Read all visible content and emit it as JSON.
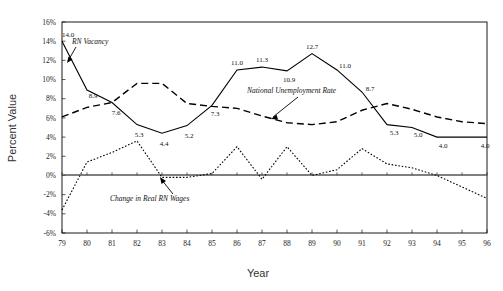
{
  "chart_data": {
    "type": "line",
    "title": "",
    "xlabel": "Year",
    "ylabel": "Percent Value",
    "x": [
      "79",
      "80",
      "81",
      "82",
      "83",
      "84",
      "85",
      "86",
      "87",
      "88",
      "89",
      "90",
      "91",
      "92",
      "93",
      "94",
      "95",
      "96"
    ],
    "ylim": [
      -6,
      16
    ],
    "yticks": [
      "16%",
      "14%",
      "12%",
      "10%",
      "8%",
      "6%",
      "4%",
      "2%",
      "0%",
      "-2%",
      "-4%",
      "-6%"
    ],
    "ytick_values": [
      16,
      14,
      12,
      10,
      8,
      6,
      4,
      2,
      0,
      -2,
      -4,
      -6
    ],
    "grid": false,
    "legend": "inline-annotations",
    "series": [
      {
        "name": "RN Vacancy",
        "style": "solid",
        "values": [
          14.0,
          8.9,
          7.6,
          5.3,
          4.4,
          5.2,
          7.3,
          11.0,
          11.3,
          10.9,
          12.7,
          11.0,
          8.7,
          5.3,
          5.0,
          4.0,
          4.0,
          4.0
        ],
        "labels": [
          "14.0",
          "8.9",
          "7.6",
          "5.3",
          "4.4",
          "5.2",
          "7.3",
          "11.0",
          "11.3",
          "10.9",
          "12.7",
          "11.0",
          "8.7",
          "5.3",
          "5.0",
          "4.0",
          "",
          "4.0"
        ]
      },
      {
        "name": "National Unemployment Rate",
        "style": "dashed",
        "values": [
          6.1,
          7.1,
          7.6,
          9.6,
          9.6,
          7.5,
          7.2,
          7.0,
          6.2,
          5.5,
          5.3,
          5.6,
          6.8,
          7.5,
          6.9,
          6.1,
          5.6,
          5.4
        ],
        "labels": []
      },
      {
        "name": "Change in Real RN Wages",
        "style": "dotted",
        "values": [
          -3.6,
          1.4,
          2.4,
          3.6,
          -0.2,
          -0.2,
          0.2,
          3.0,
          -0.4,
          3.0,
          0.0,
          0.6,
          2.8,
          1.2,
          0.8,
          0.0,
          -1.2,
          -2.4
        ],
        "labels": []
      }
    ],
    "annotations": [
      {
        "name": "rn-vacancy-annotation",
        "text": "RN Vacancy"
      },
      {
        "name": "national-unemployment-annotation",
        "text": "National Unemployment Rate"
      },
      {
        "name": "change-real-wages-annotation",
        "text": "Change in Real RN Wages"
      }
    ]
  },
  "axes": {
    "y_title": "Percent Value",
    "x_title": "Year"
  }
}
